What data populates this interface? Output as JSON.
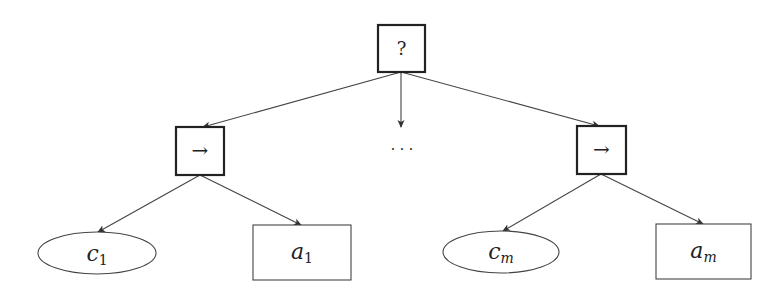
{
  "diagram": {
    "title": "",
    "root": {
      "id": "fallback",
      "label": "?",
      "kind": "square-thick"
    },
    "branches": [
      {
        "id": "seq-1",
        "label": "→",
        "kind": "square-thick",
        "condition": {
          "base": "c",
          "sub": "1",
          "kind": "ellipse"
        },
        "action": {
          "base": "a",
          "sub": "1",
          "kind": "rectangle"
        }
      },
      {
        "id": "seq-m",
        "label": "→",
        "kind": "square-thick",
        "condition": {
          "base": "c",
          "sub": "m",
          "kind": "ellipse"
        },
        "action": {
          "base": "a",
          "sub": "m",
          "kind": "rectangle"
        }
      }
    ],
    "ellipsis": "· · ·",
    "colors": {
      "stroke": "#333333",
      "text": "#222222",
      "background": "#ffffff"
    }
  }
}
